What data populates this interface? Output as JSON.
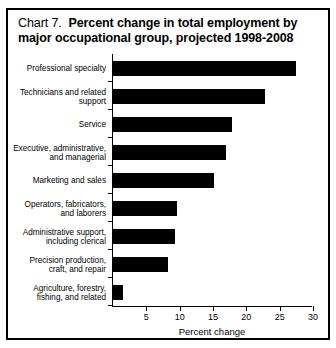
{
  "chart": {
    "title_prefix": "Chart 7.",
    "title_main": "Percent change in total employment by major occupational group, projected 1998-2008"
  },
  "chart_data": {
    "type": "bar",
    "orientation": "horizontal",
    "xlabel": "Percent change",
    "ylabel": "",
    "xlim": [
      0,
      30
    ],
    "xticks": [
      0,
      5,
      10,
      15,
      20,
      25,
      30
    ],
    "xtick_labels": [
      "",
      "5",
      "10",
      "15",
      "20",
      "25",
      "30"
    ],
    "grid": false,
    "legend": null,
    "bar_color": "#000000",
    "categories": [
      "Professional specialty",
      "Technicians and related\nsupport",
      "Service",
      "Executive, administrative,\nand managerial",
      "Marketing and sales",
      "Operators, fabricators,\nand laborers",
      "Administrative support,\nincluding clerical",
      "Precision production,\ncraft, and repair",
      "Agriculture, forestry,\nfishing, and related"
    ],
    "values": [
      27.4,
      22.8,
      17.8,
      17.0,
      15.2,
      9.6,
      9.3,
      8.2,
      1.5
    ]
  }
}
